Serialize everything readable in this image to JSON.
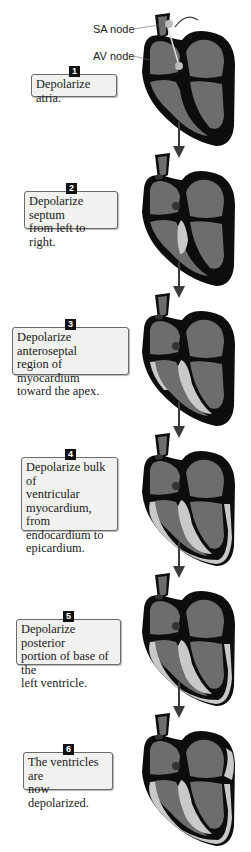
{
  "diagram": {
    "labels": {
      "sa_node": "SA node",
      "av_node": "AV node"
    },
    "colors": {
      "wall": "#0d0d0d",
      "chamber": "#6d6d6d",
      "depolarized": "#c9c9c9",
      "arrow": "#3a3a3a"
    },
    "steps": [
      {
        "number": "1",
        "lines": [
          "Depolarize atria."
        ]
      },
      {
        "number": "2",
        "lines": [
          "Depolarize septum",
          "from left to right."
        ]
      },
      {
        "number": "3",
        "lines": [
          "Depolarize anteroseptal",
          "region of myocardium",
          "toward the apex."
        ]
      },
      {
        "number": "4",
        "lines": [
          "Depolarize bulk of",
          "ventricular",
          "myocardium, from",
          "endocardium to",
          "epicardium."
        ]
      },
      {
        "number": "5",
        "lines": [
          "Depolarize posterior",
          "portion of base of the",
          "left ventricle."
        ]
      },
      {
        "number": "6",
        "lines": [
          "The ventricles are",
          "now depolarized."
        ]
      }
    ]
  }
}
